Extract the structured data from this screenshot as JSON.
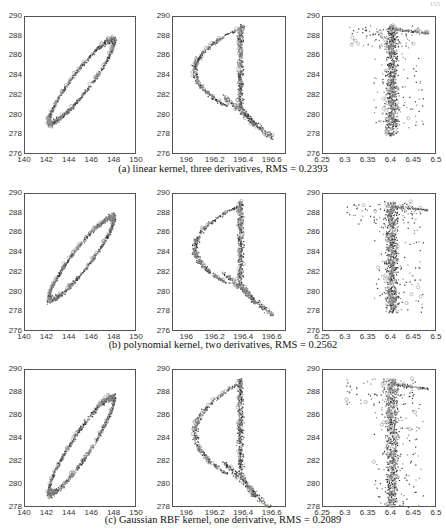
{
  "page_number": "155",
  "rows": [
    {
      "caption": "(a) linear kernel, three derivatives, RMS = 0.2393",
      "top": 16,
      "bottom": 154,
      "caption_y": 163,
      "plots": [
        {
          "left": 24,
          "right": 136,
          "xticks": [
            "140",
            "142",
            "144",
            "146",
            "148",
            "150"
          ],
          "xrange": [
            140,
            150
          ],
          "yticks": [
            "276",
            "278",
            "280",
            "282",
            "284",
            "286",
            "288",
            "290"
          ],
          "yrange": [
            276,
            290
          ],
          "shape": "ellipse_a"
        },
        {
          "left": 172,
          "right": 286,
          "xticks": [
            "196",
            "196.2",
            "196.4",
            "196.6"
          ],
          "xrange": [
            195.9,
            196.7
          ],
          "yticks": [
            "276",
            "278",
            "280",
            "282",
            "284",
            "286",
            "288",
            "290"
          ],
          "yrange": [
            276,
            290
          ],
          "shape": "d_a"
        },
        {
          "left": 322,
          "right": 436,
          "xticks": [
            "6.25",
            "6.3",
            "6.35",
            "6.4",
            "6.45",
            "6.5"
          ],
          "xrange": [
            6.25,
            6.5
          ],
          "yticks": [
            "276",
            "278",
            "280",
            "282",
            "284",
            "286",
            "288",
            "290"
          ],
          "yrange": [
            276,
            290
          ],
          "shape": "band_a"
        }
      ]
    },
    {
      "caption": "(b) polynomial kernel, two derivatives, RMS = 0.2562",
      "top": 193,
      "bottom": 331,
      "caption_y": 339,
      "plots": [
        {
          "left": 24,
          "right": 136,
          "xticks": [
            "140",
            "142",
            "144",
            "146",
            "148",
            "150"
          ],
          "xrange": [
            140,
            150
          ],
          "yticks": [
            "276",
            "278",
            "280",
            "282",
            "284",
            "286",
            "288",
            "290"
          ],
          "yrange": [
            276,
            290
          ],
          "shape": "ellipse_b"
        },
        {
          "left": 172,
          "right": 286,
          "xticks": [
            "196",
            "196.2",
            "196.4",
            "196.6"
          ],
          "xrange": [
            195.9,
            196.7
          ],
          "yticks": [
            "276",
            "278",
            "280",
            "282",
            "284",
            "286",
            "288",
            "290"
          ],
          "yrange": [
            276,
            290
          ],
          "shape": "d_b"
        },
        {
          "left": 322,
          "right": 436,
          "xticks": [
            "6.25",
            "6.3",
            "6.35",
            "6.4",
            "6.45",
            "6.5"
          ],
          "xrange": [
            6.25,
            6.5
          ],
          "yticks": [
            "276",
            "278",
            "280",
            "282",
            "284",
            "286",
            "288",
            "290"
          ],
          "yrange": [
            276,
            290
          ],
          "shape": "band_b"
        }
      ]
    },
    {
      "caption": "(c) Gaussian RBF kernel, one derivative, RMS = 0.2089",
      "top": 369,
      "bottom": 507,
      "caption_y": 514,
      "plots": [
        {
          "left": 24,
          "right": 136,
          "xticks": [
            "140",
            "142",
            "144",
            "146",
            "148",
            "150"
          ],
          "xrange": [
            140,
            150
          ],
          "yticks": [
            "278",
            "280",
            "282",
            "284",
            "286",
            "288",
            "290"
          ],
          "yrange": [
            278,
            290
          ],
          "shape": "ellipse_c"
        },
        {
          "left": 172,
          "right": 286,
          "xticks": [
            "196",
            "196.2",
            "196.4",
            "196.6"
          ],
          "xrange": [
            195.9,
            196.7
          ],
          "yticks": [
            "278",
            "280",
            "282",
            "284",
            "286",
            "288",
            "290"
          ],
          "yrange": [
            278,
            290
          ],
          "shape": "d_c"
        },
        {
          "left": 322,
          "right": 436,
          "xticks": [
            "6.25",
            "6.3",
            "6.35",
            "6.4",
            "6.45",
            "6.5"
          ],
          "xrange": [
            6.25,
            6.5
          ],
          "yticks": [
            "278",
            "280",
            "282",
            "284",
            "286",
            "288",
            "290"
          ],
          "yrange": [
            278,
            290
          ],
          "shape": "band_c"
        }
      ]
    }
  ],
  "chart_data": [
    {
      "type": "scatter",
      "panel": "(a) left",
      "title": "",
      "xlabel": "",
      "ylabel": "",
      "xlim": [
        140,
        150
      ],
      "ylim": [
        276,
        290
      ],
      "xticks": [
        140,
        142,
        144,
        146,
        148,
        150
      ],
      "yticks": [
        276,
        278,
        280,
        282,
        284,
        286,
        288,
        290
      ],
      "description": "Elongated hysteresis loop from (141.5,278) to (148.5,289)",
      "caption": "(a) linear kernel, three derivatives, RMS = 0.2393"
    },
    {
      "type": "scatter",
      "panel": "(a) middle",
      "xlim": [
        195.9,
        196.7
      ],
      "ylim": [
        276,
        290
      ],
      "xticks": [
        196,
        196.2,
        196.4,
        196.6
      ],
      "yticks": [
        276,
        278,
        280,
        282,
        284,
        286,
        288,
        290
      ],
      "description": "D-shaped loop: left arc near 196.05 at y~285, dense vertical band near 196.35-196.4, tail to (196.6,277.5)"
    },
    {
      "type": "scatter",
      "panel": "(a) right",
      "xlim": [
        6.25,
        6.5
      ],
      "ylim": [
        276,
        290
      ],
      "xticks": [
        6.25,
        6.3,
        6.35,
        6.4,
        6.45,
        6.5
      ],
      "yticks": [
        276,
        278,
        280,
        282,
        284,
        286,
        288,
        290
      ],
      "description": "Vertical band centered ~6.4 from y=277.5 to 289, top cap to 6.48, outlier at (6.355,285)"
    },
    {
      "type": "scatter",
      "panel": "(b) left",
      "xlim": [
        140,
        150
      ],
      "ylim": [
        276,
        290
      ],
      "xticks": [
        140,
        142,
        144,
        146,
        148,
        150
      ],
      "yticks": [
        276,
        278,
        280,
        282,
        284,
        286,
        288,
        290
      ],
      "caption": "(b) polynomial kernel, two derivatives, RMS = 0.2562"
    },
    {
      "type": "scatter",
      "panel": "(b) middle",
      "xlim": [
        195.9,
        196.7
      ],
      "ylim": [
        276,
        290
      ],
      "xticks": [
        196,
        196.2,
        196.4,
        196.6
      ],
      "yticks": [
        276,
        278,
        280,
        282,
        284,
        286,
        288,
        290
      ]
    },
    {
      "type": "scatter",
      "panel": "(b) right",
      "xlim": [
        6.25,
        6.5
      ],
      "ylim": [
        276,
        290
      ],
      "xticks": [
        6.25,
        6.3,
        6.35,
        6.4,
        6.45,
        6.5
      ],
      "yticks": [
        276,
        278,
        280,
        282,
        284,
        286,
        288,
        290
      ]
    },
    {
      "type": "scatter",
      "panel": "(c) left",
      "xlim": [
        140,
        150
      ],
      "ylim": [
        278,
        290
      ],
      "xticks": [
        140,
        142,
        144,
        146,
        148,
        150
      ],
      "yticks": [
        278,
        280,
        282,
        284,
        286,
        288,
        290
      ],
      "caption": "(c) Gaussian RBF kernel, one derivative, RMS = 0.2089"
    },
    {
      "type": "scatter",
      "panel": "(c) middle",
      "xlim": [
        195.9,
        196.7
      ],
      "ylim": [
        278,
        290
      ],
      "xticks": [
        196,
        196.2,
        196.4,
        196.6
      ],
      "yticks": [
        278,
        280,
        282,
        284,
        286,
        288,
        290
      ]
    },
    {
      "type": "scatter",
      "panel": "(c) right",
      "xlim": [
        6.25,
        6.5
      ],
      "ylim": [
        278,
        290
      ],
      "xticks": [
        6.25,
        6.3,
        6.35,
        6.4,
        6.45,
        6.5
      ],
      "yticks": [
        278,
        280,
        282,
        284,
        286,
        288,
        290
      ]
    }
  ]
}
